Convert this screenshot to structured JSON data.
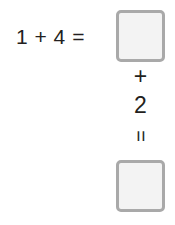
{
  "worksheet": {
    "equation": {
      "expression": "1 + 4 =",
      "first_operand": "1",
      "operator": "+",
      "second_operand": "4",
      "equals": "="
    },
    "answer_box_1": {
      "value": "",
      "placeholder": ""
    },
    "continuation": {
      "operator": "+",
      "operand": "2",
      "equals": "="
    },
    "answer_box_2": {
      "value": "",
      "placeholder": ""
    },
    "colors": {
      "background": "#ffffff",
      "text": "#231f20",
      "box_border": "#a9a9a9",
      "box_fill": "#f3f3f3"
    }
  }
}
